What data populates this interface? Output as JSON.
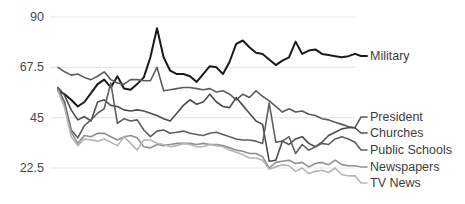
{
  "chart_data": {
    "type": "line",
    "title": "",
    "subtitle": "",
    "xlabel": "",
    "ylabel": "",
    "ylim": [
      11.25,
      90
    ],
    "yticks": [
      90,
      67.5,
      45,
      22.5
    ],
    "ytick_labels": [
      "90",
      "67.5",
      "45",
      "22.5"
    ],
    "grid": "horizontal",
    "legend_position": "right-inline",
    "xlim": [
      0,
      46
    ],
    "x": [
      0,
      1,
      2,
      3,
      4,
      5,
      6,
      7,
      8,
      9,
      10,
      11,
      12,
      13,
      14,
      15,
      16,
      17,
      18,
      19,
      20,
      21,
      22,
      23,
      24,
      25,
      26,
      27,
      28,
      29,
      30,
      31,
      32,
      33,
      34,
      35,
      36,
      37,
      38,
      39,
      40,
      41,
      42,
      43,
      44,
      45
    ],
    "series": [
      {
        "name": "Military",
        "color": "#1a1a1a",
        "label_y_px": 56,
        "values": [
          57.0,
          55.5,
          53.0,
          50.0,
          52.0,
          56.0,
          60.0,
          62.0,
          58.5,
          63.5,
          58.0,
          57.5,
          60.0,
          63.0,
          72.0,
          85.0,
          72.0,
          66.0,
          64.5,
          64.5,
          63.5,
          61.0,
          64.5,
          68.0,
          67.5,
          64.5,
          70.0,
          78.0,
          79.5,
          76.5,
          74.0,
          73.5,
          71.0,
          68.5,
          70.5,
          72.0,
          79.0,
          73.5,
          75.0,
          75.5,
          73.5,
          73.0,
          72.5,
          72.0,
          72.5,
          73.5
        ]
      },
      {
        "name": "President",
        "color": "#5c5c5c",
        "label_y_px": 117,
        "values": [
          67.5,
          65.5,
          64.0,
          64.5,
          63.0,
          62.0,
          63.5,
          65.5,
          62.0,
          60.5,
          60.0,
          62.0,
          62.0,
          61.5,
          61.5,
          67.5,
          57.0,
          57.5,
          58.0,
          58.5,
          58.5,
          58.0,
          57.5,
          58.0,
          56.5,
          57.0,
          55.5,
          53.0,
          55.5,
          54.0,
          57.0,
          54.5,
          52.5,
          50.0,
          47.5,
          49.0,
          47.5,
          48.0,
          46.5,
          46.0,
          44.5,
          44.0,
          43.0,
          42.0,
          41.0,
          40.5
        ]
      },
      {
        "name": "Churches",
        "color": "#4d4d4d",
        "label_y_px": 133,
        "values": [
          58.5,
          55.0,
          48.5,
          44.0,
          45.5,
          43.5,
          52.0,
          53.0,
          50.5,
          50.0,
          48.5,
          48.0,
          48.5,
          48.0,
          47.0,
          46.0,
          44.5,
          43.5,
          47.0,
          50.5,
          53.0,
          51.0,
          52.0,
          55.5,
          52.0,
          50.0,
          49.5,
          54.0,
          50.5,
          47.0,
          43.5,
          42.0,
          25.5,
          26.0,
          34.5,
          33.0,
          35.5,
          36.5,
          33.5,
          32.0,
          34.0,
          37.0,
          38.5,
          40.0,
          40.5,
          40.5
        ]
      },
      {
        "name": "Public Schools",
        "color": "#5f5f5f",
        "label_y_px": 150,
        "values": [
          58.0,
          52.0,
          39.5,
          36.0,
          41.5,
          44.0,
          47.0,
          49.0,
          60.5,
          42.5,
          44.5,
          43.5,
          44.0,
          39.5,
          36.5,
          39.0,
          39.5,
          38.0,
          38.5,
          39.0,
          38.0,
          37.5,
          37.0,
          38.0,
          38.5,
          37.5,
          36.5,
          35.5,
          35.0,
          35.0,
          34.5,
          33.5,
          51.5,
          34.0,
          34.5,
          36.5,
          29.0,
          33.0,
          30.5,
          32.0,
          33.5,
          33.0,
          35.5,
          36.5,
          35.5,
          34.0
        ]
      },
      {
        "name": "Newspapers",
        "color": "#909090",
        "label_y_px": 167,
        "values": [
          57.5,
          50.0,
          38.5,
          33.5,
          37.0,
          36.5,
          38.0,
          38.0,
          36.5,
          35.0,
          36.5,
          37.0,
          36.0,
          32.0,
          31.5,
          33.0,
          32.5,
          33.0,
          33.5,
          33.5,
          33.5,
          33.0,
          33.5,
          33.0,
          33.0,
          32.5,
          31.5,
          30.5,
          30.0,
          29.0,
          29.0,
          27.5,
          22.5,
          25.0,
          25.5,
          26.0,
          24.5,
          25.0,
          23.0,
          24.5,
          25.0,
          24.0,
          26.0,
          24.0,
          23.5,
          23.5
        ]
      },
      {
        "name": "TV News",
        "color": "#b5b5b5",
        "label_y_px": 183,
        "values": [
          57.0,
          49.5,
          36.5,
          32.5,
          35.5,
          35.0,
          34.5,
          35.5,
          34.0,
          32.5,
          36.5,
          33.5,
          30.5,
          35.0,
          35.0,
          33.5,
          33.0,
          32.0,
          32.5,
          33.5,
          33.0,
          32.0,
          32.0,
          33.0,
          32.5,
          32.0,
          30.5,
          29.5,
          28.5,
          27.0,
          27.0,
          26.0,
          22.0,
          23.0,
          24.0,
          23.5,
          21.0,
          22.5,
          20.0,
          21.0,
          21.5,
          20.5,
          22.5,
          19.5,
          19.0,
          19.0
        ]
      }
    ]
  },
  "layout": {
    "plot_left_px": 50,
    "plot_right_px": 355,
    "data_start_px": 58,
    "grid_color": "#e8e8e8"
  }
}
